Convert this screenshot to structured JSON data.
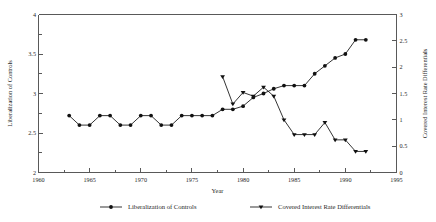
{
  "chart_data": {
    "type": "line",
    "title": "",
    "xlabel": "Year",
    "ylabel": "Liberalization of Controls",
    "y2label": "Covered Interest Rate Differentials",
    "xlim": [
      1960,
      1995
    ],
    "ylim": [
      2,
      4
    ],
    "y2lim": [
      0,
      3
    ],
    "grid": false,
    "legend_position": "bottom",
    "x_ticks": [
      1960,
      1965,
      1970,
      1975,
      1980,
      1985,
      1990,
      1995
    ],
    "x_tick_labels": [
      "1960",
      "1965",
      "1970",
      "1975",
      "1980",
      "1985",
      "1990",
      "1995"
    ],
    "x_minor_ticks": [
      1962.5,
      1967.5,
      1972.5,
      1977.5,
      1982.5,
      1987.5,
      1992.5
    ],
    "y_ticks": [
      2,
      2.5,
      3,
      3.5,
      4
    ],
    "y_tick_labels": [
      "2",
      "2.5",
      "3",
      "3.5",
      "4"
    ],
    "y_minor_ticks": [
      2.25,
      2.75,
      3.25,
      3.75
    ],
    "y2_ticks": [
      0,
      0.5,
      1,
      1.5,
      2,
      2.5,
      3
    ],
    "y2_tick_labels": [
      "0",
      "0.5",
      "1",
      "1.5",
      "2",
      "2.5",
      "3"
    ],
    "series": [
      {
        "name": "Liberalization of Controls",
        "axis": "left",
        "marker": "circle",
        "x": [
          1963,
          1964,
          1965,
          1966,
          1967,
          1968,
          1969,
          1970,
          1971,
          1972,
          1973,
          1974,
          1975,
          1976,
          1977,
          1978,
          1979,
          1980,
          1981,
          1982,
          1983,
          1984,
          1985,
          1986,
          1987,
          1988,
          1989,
          1990,
          1991,
          1992
        ],
        "values": [
          2.72,
          2.6,
          2.6,
          2.72,
          2.72,
          2.6,
          2.6,
          2.72,
          2.72,
          2.6,
          2.6,
          2.72,
          2.72,
          2.72,
          2.72,
          2.8,
          2.8,
          2.84,
          2.95,
          3.0,
          3.06,
          3.1,
          3.1,
          3.1,
          3.25,
          3.35,
          3.45,
          3.5,
          3.68,
          3.68
        ]
      },
      {
        "name": "Covered Interest Rate Differentials",
        "axis": "right",
        "marker": "triangle",
        "x": [
          1978,
          1979,
          1980,
          1981,
          1982,
          1983,
          1984,
          1985,
          1986,
          1987,
          1988,
          1989,
          1990,
          1991,
          1992
        ],
        "values": [
          1.82,
          1.3,
          1.52,
          1.45,
          1.62,
          1.45,
          1.0,
          0.72,
          0.72,
          0.72,
          0.95,
          0.62,
          0.62,
          0.4,
          0.4
        ]
      }
    ]
  },
  "legend": {
    "items": [
      {
        "label": "Liberalization of Controls",
        "marker": "circle"
      },
      {
        "label": "Covered Interest Rate Differentials",
        "marker": "triangle"
      }
    ]
  },
  "colors": {
    "line": "#111111",
    "axis": "#595959",
    "background": "#ffffff"
  }
}
